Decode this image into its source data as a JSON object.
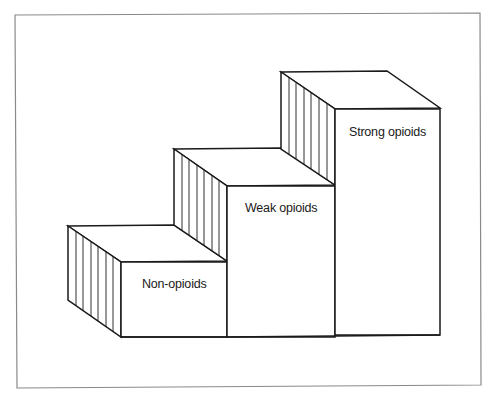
{
  "diagram": {
    "colors": {
      "background": "#ffffff",
      "line": "#1a1a1a",
      "frame": "#8a8a8a"
    },
    "steps": [
      {
        "label": "Non-opioids",
        "level": 1
      },
      {
        "label": "Weak opioids",
        "level": 2
      },
      {
        "label": "Strong opioids",
        "level": 3
      }
    ]
  }
}
